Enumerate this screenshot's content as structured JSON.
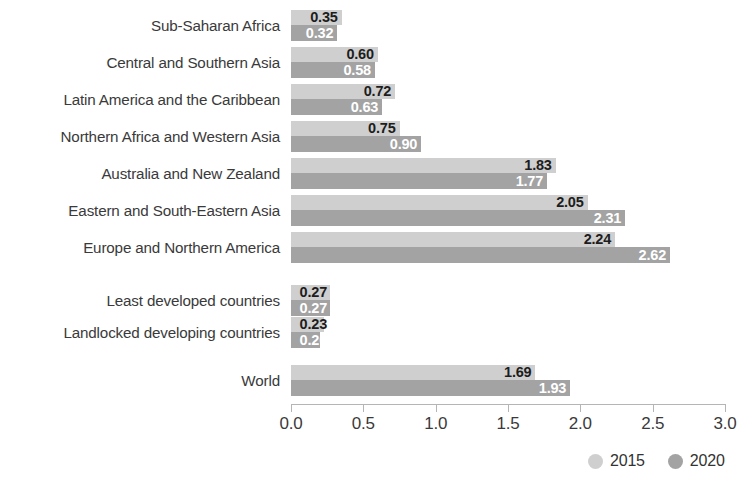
{
  "chart_data": {
    "type": "bar",
    "orientation": "horizontal",
    "title": "",
    "subtitle": "",
    "xlabel": "",
    "ylabel": "",
    "xlim": [
      0.0,
      3.0
    ],
    "xticks": [
      "0.0",
      "0.5",
      "1.0",
      "1.5",
      "2.0",
      "2.5",
      "3.0"
    ],
    "xtick_values": [
      0.0,
      0.5,
      1.0,
      1.5,
      2.0,
      2.5,
      3.0
    ],
    "grid": false,
    "legend_position": "bottom-right",
    "categories": [
      "Sub-Saharan Africa",
      "Central and Southern Asia",
      "Latin America and the Caribbean",
      "Northern Africa and Western Asia",
      "Australia and New Zealand",
      "Eastern and South-Eastern Asia",
      "Europe and Northern America",
      "Least developed countries",
      "Landlocked developing countries",
      "World"
    ],
    "series": [
      {
        "name": "2015",
        "color": "#cfcfcf",
        "values": [
          0.35,
          0.6,
          0.72,
          0.75,
          1.83,
          2.05,
          2.24,
          0.27,
          0.23,
          1.69
        ],
        "labels": [
          "0.35",
          "0.60",
          "0.72",
          "0.75",
          "1.83",
          "2.05",
          "2.24",
          "0.27",
          "0.23",
          "1.69"
        ]
      },
      {
        "name": "2020",
        "color": "#a3a3a3",
        "values": [
          0.32,
          0.58,
          0.63,
          0.9,
          1.77,
          2.31,
          2.62,
          0.27,
          0.2,
          1.93
        ],
        "labels": [
          "0.32",
          "0.58",
          "0.63",
          "0.90",
          "1.77",
          "2.31",
          "2.62",
          "0.27",
          "0.20",
          "1.93"
        ]
      }
    ],
    "row_tops": [
      10,
      47,
      84,
      121,
      158,
      195,
      232,
      285,
      317,
      365
    ],
    "group_breaks_after": [
      6,
      8
    ]
  },
  "legend": {
    "items": [
      {
        "label": "2015",
        "color": "#cfcfcf",
        "dot": "legend-dot-2015"
      },
      {
        "label": "2020",
        "color": "#a3a3a3",
        "dot": "legend-dot-2020"
      }
    ]
  },
  "axis": {
    "tick_labels": [
      "0.0",
      "0.5",
      "1.0",
      "1.5",
      "2.0",
      "2.5",
      "3.0"
    ]
  }
}
